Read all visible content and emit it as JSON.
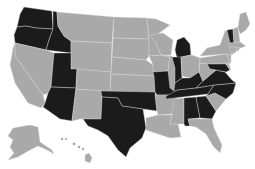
{
  "map": {
    "title": "United States map",
    "colors": {
      "highlighted": "#1b1b1b",
      "default": "#a9a9a9",
      "border": "#d9d9d9",
      "background": "#ffffff"
    },
    "highlighted_states": [
      "WA",
      "OR",
      "ID",
      "UT",
      "AZ",
      "TX",
      "OK",
      "MO",
      "WI",
      "MI",
      "IN",
      "KY",
      "TN",
      "VA",
      "NC",
      "MD",
      "AL",
      "GA",
      "VT"
    ],
    "states": [
      {
        "id": "WA",
        "name": "Washington",
        "highlighted": true,
        "points": "24,7 52,11 53,29 36,28 26,26 17,27 20,14"
      },
      {
        "id": "OR",
        "name": "Oregon",
        "highlighted": true,
        "points": "17,27 26,26 36,28 53,29 49,40 46,50 15,43 14,35"
      },
      {
        "id": "ID",
        "name": "Idaho",
        "highlighted": true,
        "points": "53,11 57,12 58,26 64,36 71,41 71,53 46,50 49,40 53,29"
      },
      {
        "id": "MT",
        "name": "Montana",
        "highlighted": false,
        "points": "57,12 114,17 112,43 71,41 64,36 58,26"
      },
      {
        "id": "WY",
        "name": "Wyoming",
        "highlighted": false,
        "points": "71,41 112,43 111,72 71,69"
      },
      {
        "id": "NV",
        "name": "Nevada",
        "highlighted": false,
        "points": "15,43 46,50 54,53 51,87 48,93 43,95 15,56"
      },
      {
        "id": "CA",
        "name": "California",
        "highlighted": false,
        "points": "13,48 15,43 15,56 43,95 45,103 41,108 28,103 15,83 10,65"
      },
      {
        "id": "UT",
        "name": "Utah",
        "highlighted": true,
        "points": "54,53 71,53 71,69 77,69 76,88 51,87"
      },
      {
        "id": "AZ",
        "name": "Arizona",
        "highlighted": true,
        "points": "51,87 76,88 72,121 60,119 43,107 45,103 48,93"
      },
      {
        "id": "CO",
        "name": "Colorado",
        "highlighted": false,
        "points": "77,69 111,72 110,92 76,89"
      },
      {
        "id": "NM",
        "name": "New Mexico",
        "highlighted": false,
        "points": "76,89 102,91 101,119 80,119 72,121"
      },
      {
        "id": "ND",
        "name": "North Dakota",
        "highlighted": false,
        "points": "114,17 147,18 149,39 113,38"
      },
      {
        "id": "SD",
        "name": "South Dakota",
        "highlighted": false,
        "points": "113,38 149,39 149,56 146,60 112,57"
      },
      {
        "id": "NE",
        "name": "Nebraska",
        "highlighted": false,
        "points": "112,57 146,60 153,65 154,76 111,74"
      },
      {
        "id": "KS",
        "name": "Kansas",
        "highlighted": false,
        "points": "111,74 154,76 155,92 110,92"
      },
      {
        "id": "OK",
        "name": "Oklahoma",
        "highlighted": true,
        "points": "101,91 155,92 157,111 143,109 122,106 118,98 102,97"
      },
      {
        "id": "TX",
        "name": "Texas",
        "highlighted": true,
        "points": "102,97 118,98 122,106 143,109 146,128 142,138 130,148 126,157 118,150 108,136 98,130 88,126 83,119 101,119"
      },
      {
        "id": "MN",
        "name": "Minnesota",
        "highlighted": false,
        "points": "147,18 156,19 170,25 158,34 156,43 161,55 149,56 149,39"
      },
      {
        "id": "IA",
        "name": "Iowa",
        "highlighted": false,
        "points": "149,56 161,55 170,57 168,71 153,72 153,65"
      },
      {
        "id": "MO",
        "name": "Missouri",
        "highlighted": true,
        "points": "153,72 168,71 172,78 177,88 178,95 157,95 155,92 154,76"
      },
      {
        "id": "AR",
        "name": "Arkansas",
        "highlighted": false,
        "points": "155,95 177,95 174,114 158,115 157,111"
      },
      {
        "id": "LA",
        "name": "Louisiana",
        "highlighted": false,
        "points": "158,115 172,115 170,124 178,124 181,137 170,138 146,130 146,118"
      },
      {
        "id": "WI",
        "name": "Wisconsin",
        "highlighted": false,
        "points": "150,35 163,33 173,40 171,55 161,55 156,43"
      },
      {
        "id": "IL",
        "name": "Illinois",
        "highlighted": false,
        "points": "161,55 172,56 175,68 177,80 174,91 170,88 168,71 170,57"
      },
      {
        "id": "MI",
        "name": "Michigan",
        "highlighted": true,
        "points": "177,40 184,37 190,44 191,55 177,58 175,50"
      },
      {
        "id": "IN",
        "name": "Indiana",
        "highlighted": true,
        "points": "172,57 181,57 182,78 175,83 175,68"
      },
      {
        "id": "OH",
        "name": "Ohio",
        "highlighted": false,
        "points": "181,57 192,55 200,58 199,72 190,78 182,76"
      },
      {
        "id": "KY",
        "name": "Kentucky",
        "highlighted": true,
        "points": "174,91 175,83 182,78 190,78 199,72 203,81 196,88 178,90"
      },
      {
        "id": "TN",
        "name": "Tennessee",
        "highlighted": true,
        "points": "166,96 178,90 196,88 214,85 208,94 166,99"
      },
      {
        "id": "MS",
        "name": "Mississippi",
        "highlighted": false,
        "points": "174,99 184,98 184,124 178,124 170,124 172,115"
      },
      {
        "id": "AL",
        "name": "Alabama",
        "highlighted": true,
        "points": "184,98 196,97 200,118 188,119 190,126 185,126 184,124"
      },
      {
        "id": "GA",
        "name": "Georgia",
        "highlighted": true,
        "points": "196,97 206,96 216,111 212,119 200,118"
      },
      {
        "id": "FL",
        "name": "Florida",
        "highlighted": false,
        "points": "188,119 212,119 214,128 222,145 220,153 213,146 206,134 196,127 190,126"
      },
      {
        "id": "SC",
        "name": "South Carolina",
        "highlighted": false,
        "points": "206,96 215,93 226,99 216,111"
      },
      {
        "id": "NC",
        "name": "North Carolina",
        "highlighted": true,
        "points": "208,94 214,85 236,83 233,93 226,99 215,93 206,96"
      },
      {
        "id": "VA",
        "name": "Virginia",
        "highlighted": true,
        "points": "196,88 203,81 210,75 216,70 225,72 232,80 236,83 214,85"
      },
      {
        "id": "WV",
        "name": "West Virginia",
        "highlighted": false,
        "points": "199,72 200,63 207,64 210,69 216,70 210,75 203,81"
      },
      {
        "id": "PA",
        "name": "Pennsylvania",
        "highlighted": false,
        "points": "200,58 226,54 230,60 226,64 207,64 200,63"
      },
      {
        "id": "MD",
        "name": "Maryland",
        "highlighted": true,
        "points": "207,64 226,64 230,70 226,72 216,70 210,69"
      },
      {
        "id": "DE",
        "name": "Delaware",
        "highlighted": false,
        "points": "226,64 229,64 231,70 230,70"
      },
      {
        "id": "NJ",
        "name": "New Jersey",
        "highlighted": false,
        "points": "226,54 231,55 231,62 229,64 226,64 230,60"
      },
      {
        "id": "NY",
        "name": "New York",
        "highlighted": false,
        "points": "200,56 207,48 220,45 225,31 230,30 234,45 236,52 231,55 226,54"
      },
      {
        "id": "VT",
        "name": "Vermont",
        "highlighted": true,
        "points": "227,30 233,29 234,43 230,43"
      },
      {
        "id": "NH",
        "name": "New Hampshire",
        "highlighted": false,
        "points": "233,29 238,27 240,42 234,43"
      },
      {
        "id": "ME",
        "name": "Maine",
        "highlighted": false,
        "points": "238,27 240,14 246,12 250,24 246,30 240,34"
      },
      {
        "id": "MA",
        "name": "Massachusetts",
        "highlighted": false,
        "points": "230,43 240,42 246,46 241,48 230,47"
      },
      {
        "id": "CT",
        "name": "Connecticut",
        "highlighted": false,
        "points": "230,47 237,47 236,52 231,53"
      },
      {
        "id": "RI",
        "name": "Rhode Island",
        "highlighted": false,
        "points": "237,47 240,48 238,51 236,51"
      },
      {
        "id": "AK",
        "name": "Alaska",
        "highlighted": false,
        "points": "13,128 30,125 38,127 40,142 52,150 54,154 47,150 38,146 30,150 18,157 8,160 14,153 10,147 13,140 8,136"
      },
      {
        "id": "HI",
        "name": "Hawaii",
        "highlighted": false,
        "points": "85,155 89,153 92,158 90,163 85,161"
      }
    ],
    "hawaii_islands": [
      {
        "cx": 62,
        "cy": 139,
        "r": 1.2
      },
      {
        "cx": 66,
        "cy": 139,
        "r": 1.1
      },
      {
        "cx": 74,
        "cy": 144,
        "r": 1.4
      },
      {
        "cx": 79,
        "cy": 147,
        "r": 1.3
      },
      {
        "cx": 83,
        "cy": 149,
        "r": 1.2
      }
    ]
  }
}
